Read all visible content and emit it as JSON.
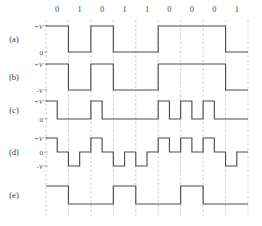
{
  "figure": {
    "bit_sequence": [
      "0",
      "1",
      "0",
      "1",
      "1",
      "0",
      "0",
      "0",
      "1"
    ],
    "bit_count": 9,
    "colors": {
      "wave": "#4d4d4d",
      "grid": "#b4b4b4",
      "text": "#3a3a3a",
      "background": "#ffffff"
    },
    "geometry": {
      "plot_left": 46,
      "plot_right": 248,
      "bit_width": 22.44,
      "bit_row_top": 12
    },
    "rows": [
      {
        "id": "a",
        "label": "(a)",
        "scheme": "unipolar-nrz",
        "axis_labels": [
          "+V",
          "0"
        ],
        "levels": [
          1,
          0
        ],
        "baseline_level": 0,
        "y_top": 26,
        "y_mid": 26,
        "y_bottom": 52,
        "return_to_zero": false,
        "values": [
          1,
          0,
          1,
          0,
          0,
          1,
          1,
          1,
          0
        ]
      },
      {
        "id": "b",
        "label": "(b)",
        "scheme": "polar-nrz-l",
        "axis_labels": [
          "+V",
          "-V"
        ],
        "levels": [
          1,
          -1
        ],
        "baseline_level": 0,
        "y_top": 64,
        "y_mid": 77,
        "y_bottom": 90,
        "return_to_zero": false,
        "values": [
          1,
          -1,
          1,
          -1,
          -1,
          1,
          1,
          1,
          -1
        ]
      },
      {
        "id": "c",
        "label": "(c)",
        "scheme": "unipolar-rz",
        "axis_labels": [
          "+V",
          "0"
        ],
        "levels": [
          1,
          0
        ],
        "baseline_level": 0,
        "y_top": 101,
        "y_mid": 101,
        "y_bottom": 119,
        "return_to_zero": true,
        "values": [
          1,
          0,
          1,
          0,
          0,
          1,
          1,
          1,
          0
        ]
      },
      {
        "id": "d",
        "label": "(d)",
        "scheme": "polar-rz",
        "axis_labels": [
          "+V",
          "0",
          "-V"
        ],
        "levels": [
          1,
          0,
          -1
        ],
        "baseline_level": 0,
        "y_top": 138,
        "y_mid": 152,
        "y_bottom": 166,
        "return_to_zero": true,
        "values": [
          1,
          -1,
          1,
          -1,
          -1,
          1,
          1,
          1,
          -1
        ]
      },
      {
        "id": "e",
        "label": "(e)",
        "scheme": "nrz-i",
        "axis_labels": [],
        "levels": [
          1,
          0
        ],
        "baseline_level": 0,
        "y_top": 186,
        "y_mid": 186,
        "y_bottom": 204,
        "return_to_zero": false,
        "values": [
          1,
          0,
          0,
          1,
          0,
          0,
          1,
          0,
          0
        ]
      }
    ]
  },
  "chart_data": {
    "type": "line",
    "xlabel": "",
    "ylabel": "",
    "grid": true,
    "legend_position": "none",
    "categories": [
      "0",
      "1",
      "0",
      "1",
      "1",
      "0",
      "0",
      "0",
      "1"
    ],
    "x": [
      0,
      1,
      2,
      3,
      4,
      5,
      6,
      7,
      8
    ],
    "series": [
      {
        "name": "(a) unipolar NRZ",
        "values": [
          1,
          0,
          1,
          0,
          0,
          1,
          1,
          1,
          0
        ],
        "ylim": [
          0,
          1
        ],
        "tick_labels": [
          "+V",
          "0"
        ]
      },
      {
        "name": "(b) polar NRZ-L",
        "values": [
          1,
          -1,
          1,
          -1,
          -1,
          1,
          1,
          1,
          -1
        ],
        "ylim": [
          -1,
          1
        ],
        "tick_labels": [
          "+V",
          "-V"
        ]
      },
      {
        "name": "(c) unipolar RZ",
        "values": [
          1,
          0,
          1,
          0,
          0,
          1,
          1,
          1,
          0
        ],
        "ylim": [
          0,
          1
        ],
        "tick_labels": [
          "+V",
          "0"
        ]
      },
      {
        "name": "(d) polar RZ",
        "values": [
          1,
          -1,
          1,
          -1,
          -1,
          1,
          1,
          1,
          -1
        ],
        "ylim": [
          -1,
          1
        ],
        "tick_labels": [
          "+V",
          "0",
          "-V"
        ]
      },
      {
        "name": "(e) NRZ-I",
        "values": [
          1,
          1,
          1,
          0,
          0,
          0,
          1,
          1,
          1
        ],
        "ylim": [
          0,
          1
        ],
        "tick_labels": []
      }
    ]
  }
}
